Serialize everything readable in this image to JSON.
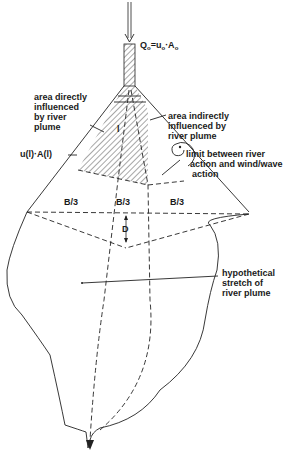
{
  "diagram": {
    "type": "river plume schematic",
    "inflow_label": {
      "main": "Q",
      "sub": "o",
      "eq": "=u",
      "sub2": "o",
      "dot": "·A",
      "sub3": "o"
    },
    "labels": {
      "direct_area": [
        "area directly",
        "influenced",
        "by river",
        "plume"
      ],
      "indirect_area": [
        "area indirectly",
        "influenced by",
        "river plume"
      ],
      "limit": [
        "limit between river",
        "action and wind/wave",
        "action"
      ],
      "ul_al": "u(l)·A(l)",
      "l_marker": "l",
      "b_third_1": "B/3",
      "b_third_2": "B/3",
      "b_third_3": "B/3",
      "d_label": "D",
      "stretch": [
        "hypothetical",
        "stretch of",
        "river plume"
      ]
    },
    "colors": {
      "line": "#222222",
      "background": "#ffffff"
    }
  }
}
